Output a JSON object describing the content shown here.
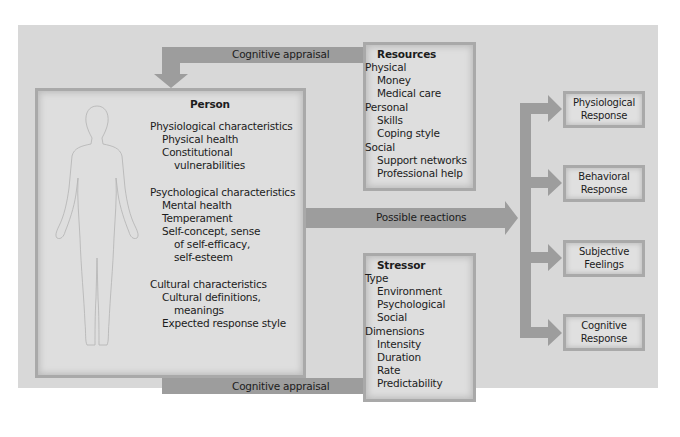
{
  "diagram": {
    "arrows": {
      "top_appraisal": "Cognitive appraisal",
      "bottom_appraisal": "Cognitive appraisal",
      "reactions": "Possible reactions"
    },
    "person": {
      "title": "Person",
      "sections": [
        {
          "heading": "Physiological characteristics",
          "items": [
            "Physical health",
            "Constitutional",
            "vulnerabilities"
          ]
        },
        {
          "heading": "Psychological characteristics",
          "items": [
            "Mental health",
            "Temperament",
            "Self-concept, sense",
            "of self-efficacy,",
            "self-esteem"
          ]
        },
        {
          "heading": "Cultural characteristics",
          "items": [
            "Cultural definitions,",
            "meanings",
            "Expected response style"
          ]
        }
      ],
      "figure_icon": "human-body-outline"
    },
    "resources": {
      "title": "Resources",
      "groups": [
        {
          "heading": "Physical",
          "items": [
            "Money",
            "Medical care"
          ]
        },
        {
          "heading": "Personal",
          "items": [
            "Skills",
            "Coping style"
          ]
        },
        {
          "heading": "Social",
          "items": [
            "Support networks",
            "Professional help"
          ]
        }
      ]
    },
    "stressor": {
      "title": "Stressor",
      "groups": [
        {
          "heading": "Type",
          "items": [
            "Environment",
            "Psychological",
            "Social"
          ]
        },
        {
          "heading": "Dimensions",
          "items": [
            "Intensity",
            "Duration",
            "Rate",
            "Predictability"
          ]
        }
      ]
    },
    "responses": [
      {
        "line1": "Physiological",
        "line2": "Response"
      },
      {
        "line1": "Behavioral",
        "line2": "Response"
      },
      {
        "line1": "Subjective",
        "line2": "Feelings"
      },
      {
        "line1": "Cognitive",
        "line2": "Response"
      }
    ],
    "colors": {
      "panel": "#d8d8d8",
      "arrow": "#9d9d9d",
      "box_fill": "#dedede",
      "box_border": "#a9a9a9"
    }
  }
}
